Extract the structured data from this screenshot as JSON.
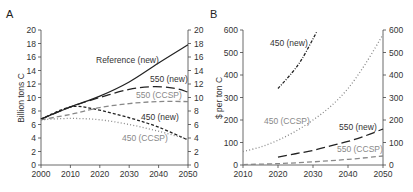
{
  "chart_data": [
    {
      "panel": "A",
      "type": "line",
      "title": "",
      "xlabel": "",
      "ylabel": "Billion tons C",
      "xlim": [
        2000,
        2050
      ],
      "ylim": [
        0,
        20
      ],
      "xticks": [
        "2000",
        "2010",
        "2020",
        "2030",
        "2040",
        "2050"
      ],
      "yticks": [
        "0",
        "2",
        "4",
        "6",
        "8",
        "10",
        "12",
        "14",
        "16",
        "18",
        "20"
      ],
      "grid": false,
      "series": [
        {
          "name": "Reference (new)",
          "color": "#222222",
          "dash": "solid",
          "x": [
            2000,
            2010,
            2020,
            2030,
            2040,
            2050
          ],
          "values": [
            6.8,
            8.6,
            10.2,
            12.3,
            15.1,
            17.8
          ]
        },
        {
          "name": "550 (new)",
          "color": "#222222",
          "dash": "long-dash",
          "x": [
            2000,
            2010,
            2020,
            2030,
            2038,
            2045,
            2050
          ],
          "values": [
            6.8,
            8.6,
            10.0,
            11.2,
            11.6,
            11.4,
            10.8
          ]
        },
        {
          "name": "550 (CCSP)",
          "color": "#888888",
          "dash": "dash",
          "x": [
            2000,
            2010,
            2020,
            2030,
            2040,
            2050
          ],
          "values": [
            6.7,
            7.5,
            8.5,
            9.1,
            9.4,
            9.4
          ]
        },
        {
          "name": "450 (new)",
          "color": "#222222",
          "dash": "short-dash",
          "x": [
            2000,
            2010,
            2018,
            2030,
            2040,
            2050
          ],
          "values": [
            6.8,
            8.6,
            8.3,
            7.0,
            5.6,
            3.7
          ]
        },
        {
          "name": "450 (CCSP)",
          "color": "#888888",
          "dash": "dotted",
          "x": [
            2000,
            2010,
            2020,
            2030,
            2040,
            2050
          ],
          "values": [
            6.7,
            6.9,
            6.7,
            6.0,
            5.0,
            3.8
          ]
        }
      ]
    },
    {
      "panel": "B",
      "type": "line",
      "title": "",
      "xlabel": "",
      "ylabel": "$ per ton C",
      "xlim": [
        2010,
        2050
      ],
      "ylim": [
        0,
        600
      ],
      "xticks": [
        "2010",
        "2020",
        "2030",
        "2040",
        "2050"
      ],
      "yticks": [
        "0",
        "100",
        "200",
        "300",
        "400",
        "500",
        "600"
      ],
      "grid": false,
      "series": [
        {
          "name": "450 (new)",
          "color": "#222222",
          "dash": "dash-dot",
          "x": [
            2020,
            2024,
            2027,
            2031
          ],
          "values": [
            340,
            410,
            475,
            590
          ]
        },
        {
          "name": "450 (CCSP)",
          "color": "#888888",
          "dash": "dotted",
          "x": [
            2010,
            2015,
            2020,
            2025,
            2030,
            2035,
            2040,
            2045,
            2050
          ],
          "values": [
            60,
            80,
            110,
            150,
            200,
            260,
            340,
            450,
            580
          ]
        },
        {
          "name": "550 (new)",
          "color": "#222222",
          "dash": "long-dash",
          "x": [
            2020,
            2025,
            2030,
            2035,
            2040,
            2045,
            2050
          ],
          "values": [
            35,
            50,
            65,
            85,
            105,
            130,
            160
          ]
        },
        {
          "name": "550 (CCSP)",
          "color": "#888888",
          "dash": "dash",
          "x": [
            2010,
            2020,
            2030,
            2040,
            2050
          ],
          "values": [
            2,
            6,
            14,
            25,
            40
          ]
        }
      ]
    }
  ],
  "labels": {
    "panel_a": "A",
    "panel_b": "B",
    "a_ylabel": "Billion tons C",
    "b_ylabel": "$ per ton C",
    "a_ref": "Reference (new)",
    "a_550new": "550 (new)",
    "a_550ccsp": "550 (CCSP)",
    "a_450new": "450 (new)",
    "a_450ccsp": "450 (CCSP)",
    "b_450new": "450 (new)",
    "b_450ccsp": "450 (CCSP)",
    "b_550new": "550 (new)",
    "b_550ccsp": "550 (CCSP)"
  }
}
